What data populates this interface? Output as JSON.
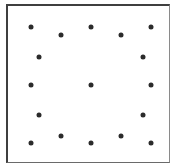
{
  "diagram": {
    "type": "dot-pattern",
    "frame": {
      "left": 6,
      "top": 4,
      "right": 170,
      "bottom": 163,
      "border_color": "#3f3f3f"
    },
    "dot_color": "#2b2b2b",
    "dot_diameter": 5,
    "dots": [
      {
        "x": 31,
        "y": 27
      },
      {
        "x": 61,
        "y": 35
      },
      {
        "x": 91,
        "y": 27
      },
      {
        "x": 121,
        "y": 35
      },
      {
        "x": 151,
        "y": 27
      },
      {
        "x": 39,
        "y": 57
      },
      {
        "x": 143,
        "y": 57
      },
      {
        "x": 31,
        "y": 85
      },
      {
        "x": 91,
        "y": 85
      },
      {
        "x": 151,
        "y": 85
      },
      {
        "x": 39,
        "y": 115
      },
      {
        "x": 143,
        "y": 115
      },
      {
        "x": 31,
        "y": 143
      },
      {
        "x": 61,
        "y": 136
      },
      {
        "x": 91,
        "y": 143
      },
      {
        "x": 121,
        "y": 136
      },
      {
        "x": 151,
        "y": 143
      }
    ]
  }
}
